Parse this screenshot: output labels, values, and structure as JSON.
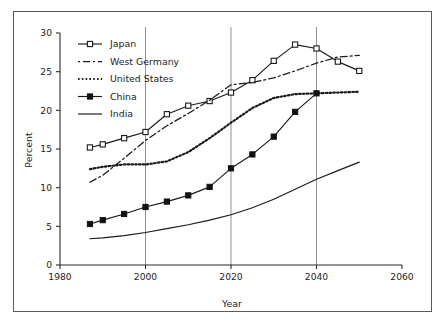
{
  "chart_data": {
    "type": "line",
    "title": "",
    "xlabel": "Year",
    "ylabel": "Percent",
    "xlim": [
      1980,
      2060
    ],
    "ylim": [
      0,
      30
    ],
    "xticks": [
      1980,
      2000,
      2020,
      2040,
      2060
    ],
    "yticks": [
      0,
      5,
      10,
      15,
      20,
      25,
      30
    ],
    "xtick_labels": [
      "1980",
      "2000",
      "2020",
      "2040",
      "2060"
    ],
    "ytick_labels": [
      "0",
      "5",
      "10",
      "15",
      "20",
      "25",
      "30"
    ],
    "grid": "vertical gridlines at 2000, 2020, 2040",
    "gridlines_x": [
      2000,
      2020,
      2040
    ],
    "legend_position": "upper left inside axes",
    "series": [
      {
        "name": "Japan",
        "style": "solid-line-open-square-markers",
        "marker": "open-square",
        "x": [
          1987,
          1990,
          1995,
          2000,
          2005,
          2010,
          2015,
          2020,
          2025,
          2030,
          2035,
          2040,
          2045,
          2050
        ],
        "values": [
          15.2,
          15.6,
          16.4,
          17.2,
          19.5,
          20.6,
          21.2,
          22.3,
          23.9,
          26.4,
          28.5,
          28.0,
          26.3,
          25.1
        ]
      },
      {
        "name": "West Germany",
        "style": "dash-dot-line",
        "marker": "none",
        "x": [
          1987,
          1990,
          1995,
          2000,
          2005,
          2010,
          2015,
          2020,
          2025,
          2030,
          2035,
          2040,
          2045,
          2050
        ],
        "values": [
          10.7,
          11.6,
          13.8,
          16.1,
          18.0,
          19.6,
          21.3,
          23.3,
          23.6,
          24.2,
          25.1,
          26.1,
          26.9,
          27.1
        ]
      },
      {
        "name": "United States",
        "style": "dotted-line",
        "marker": "none",
        "x": [
          1987,
          1990,
          1995,
          2000,
          2005,
          2010,
          2015,
          2020,
          2025,
          2030,
          2035,
          2040,
          2045,
          2050
        ],
        "values": [
          12.4,
          12.7,
          13.0,
          13.0,
          13.4,
          14.6,
          16.4,
          18.4,
          20.3,
          21.6,
          22.1,
          22.2,
          22.3,
          22.4
        ]
      },
      {
        "name": "China",
        "style": "solid-line-filled-square-markers",
        "marker": "filled-square",
        "x": [
          1987,
          1990,
          1995,
          2000,
          2005,
          2010,
          2015,
          2020,
          2025,
          2030,
          2035,
          2040
        ],
        "values": [
          5.3,
          5.8,
          6.6,
          7.5,
          8.2,
          9.0,
          10.1,
          12.5,
          14.3,
          16.6,
          19.8,
          22.2
        ]
      },
      {
        "name": "India",
        "style": "solid-line",
        "marker": "none",
        "x": [
          1987,
          1990,
          1995,
          2000,
          2005,
          2010,
          2015,
          2020,
          2025,
          2030,
          2035,
          2040,
          2045,
          2050
        ],
        "values": [
          3.4,
          3.5,
          3.8,
          4.2,
          4.7,
          5.2,
          5.8,
          6.5,
          7.4,
          8.5,
          9.8,
          11.1,
          12.2,
          13.3
        ]
      }
    ]
  },
  "legend": {
    "items": [
      {
        "label": "Japan",
        "swatch": "line-open-square"
      },
      {
        "label": "West Germany",
        "swatch": "dash-dot"
      },
      {
        "label": "United States",
        "swatch": "dotted"
      },
      {
        "label": "China",
        "swatch": "line-filled-square"
      },
      {
        "label": "India",
        "swatch": "solid"
      }
    ]
  },
  "axes": {
    "x_title": "Year",
    "y_title": "Percent"
  },
  "colors": {
    "ink": "#1a1a1a",
    "grid": "#8d9296",
    "frame": "#555b5e",
    "background": "#ffffff"
  }
}
